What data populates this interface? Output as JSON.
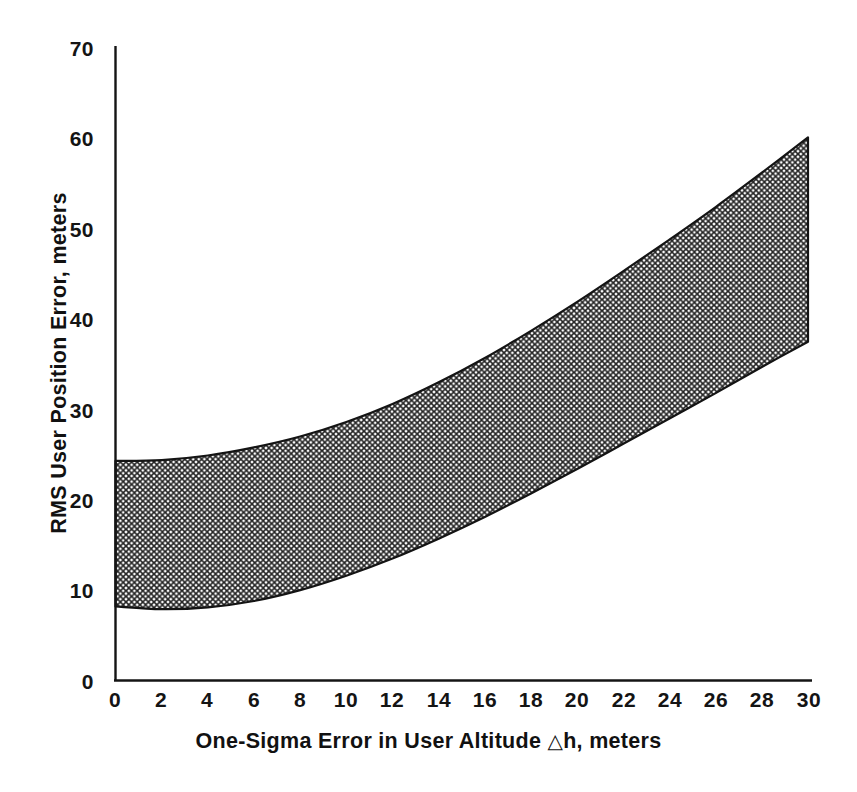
{
  "chart_data": {
    "type": "area",
    "title": "",
    "xlabel": "One-Sigma Error in User Altitude △h, meters",
    "ylabel": "RMS User Position Error, meters",
    "xlim": [
      0,
      30
    ],
    "ylim": [
      0,
      70
    ],
    "xticks": [
      0,
      2,
      4,
      6,
      8,
      10,
      12,
      14,
      16,
      18,
      20,
      22,
      24,
      26,
      28,
      30
    ],
    "yticks": [
      0,
      10,
      20,
      30,
      40,
      50,
      60,
      70
    ],
    "xtick_labels": [
      "0",
      "2",
      "4",
      "6",
      "8",
      "10",
      "12",
      "14",
      "16",
      "18",
      "20",
      "22",
      "24",
      "26",
      "28",
      "30"
    ],
    "ytick_labels": [
      "0",
      "10",
      "20",
      "30",
      "40",
      "50",
      "60",
      "70"
    ],
    "grid": false,
    "legend": "none",
    "band_fill": "crosshatch",
    "band_color": "#1a1a1a",
    "background": "#ffffff",
    "x": [
      0,
      2,
      4,
      6,
      8,
      10,
      12,
      14,
      16,
      18,
      20,
      22,
      24,
      26,
      28,
      30
    ],
    "series": [
      {
        "name": "Upper bound",
        "values": [
          24.3,
          24.4,
          24.9,
          25.8,
          27.0,
          28.6,
          30.6,
          33.0,
          35.7,
          38.7,
          41.9,
          45.3,
          48.8,
          52.4,
          56.2,
          60.1
        ]
      },
      {
        "name": "Lower bound",
        "values": [
          8.2,
          7.9,
          8.1,
          8.8,
          10.0,
          11.6,
          13.5,
          15.7,
          18.1,
          20.7,
          23.4,
          26.2,
          29.0,
          31.8,
          34.7,
          37.5
        ]
      }
    ],
    "annotations": []
  },
  "axis_titles": {
    "x_prefix": "One-Sigma Error in User Altitude",
    "x_delta": "△",
    "x_suffix": "h, meters",
    "y": "RMS User Position Error, meters"
  }
}
